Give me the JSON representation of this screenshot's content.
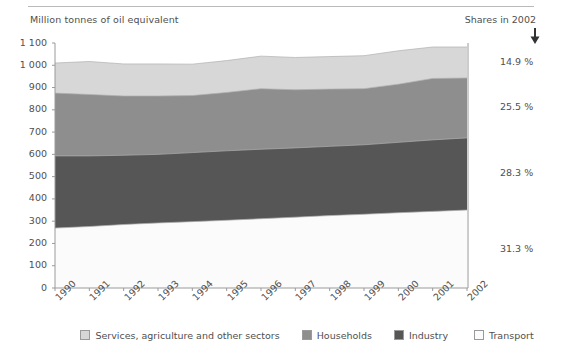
{
  "header": {
    "y_axis_title": "Million tonnes of oil equivalent",
    "shares_title": "Shares in 2002",
    "arrow_icon": "down-arrow-icon"
  },
  "axes": {
    "y_ticks": [
      "0",
      "100",
      "200",
      "300",
      "400",
      "500",
      "600",
      "700",
      "800",
      "900",
      "1 000",
      "1 100"
    ],
    "y_values": [
      0,
      100,
      200,
      300,
      400,
      500,
      600,
      700,
      800,
      900,
      1000,
      1100
    ],
    "x_ticks": [
      "1990",
      "1991",
      "1992",
      "1993",
      "1994",
      "1995",
      "1996",
      "1997",
      "1998",
      "1999",
      "2000",
      "2001",
      "2002"
    ]
  },
  "shares": [
    {
      "label": "14.9 %",
      "series": "Services, agriculture and other sectors"
    },
    {
      "label": "25.5 %",
      "series": "Households"
    },
    {
      "label": "28.3 %",
      "series": "Industry"
    },
    {
      "label": "31.3 %",
      "series": "Transport"
    }
  ],
  "legend": [
    {
      "label": "Services, agriculture and other sectors",
      "color": "#d7d7d7"
    },
    {
      "label": "Households",
      "color": "#8e8e8e"
    },
    {
      "label": "Industry",
      "color": "#565656"
    },
    {
      "label": "Transport",
      "color": "#fbfbfb"
    }
  ],
  "colors": {
    "services": "#d7d7d7",
    "households": "#8e8e8e",
    "industry": "#565656",
    "transport": "#fbfbfb",
    "axis": "#9a9a9a",
    "text": "#4f4f4f",
    "band_edge": "#b0b0b0"
  },
  "chart_data": {
    "type": "area",
    "title": "",
    "subtitle": "",
    "xlabel": "",
    "ylabel": "Million tonnes of oil equivalent",
    "ylim": [
      0,
      1100
    ],
    "grid": false,
    "legend_position": "bottom",
    "stacked": true,
    "stack_order_bottom_to_top": [
      "Transport",
      "Industry",
      "Households",
      "Services, agriculture and other sectors"
    ],
    "x": [
      1990,
      1991,
      1992,
      1993,
      1994,
      1995,
      1996,
      1997,
      1998,
      1999,
      2000,
      2001,
      2002
    ],
    "categories": [
      "1990",
      "1991",
      "1992",
      "1993",
      "1994",
      "1995",
      "1996",
      "1997",
      "1998",
      "1999",
      "2000",
      "2001",
      "2002"
    ],
    "series": [
      {
        "name": "Transport",
        "color": "#fbfbfb",
        "share_2002": "31.3 %",
        "values": [
          269,
          276,
          285,
          292,
          298,
          304,
          311,
          318,
          325,
          331,
          338,
          344,
          350
        ]
      },
      {
        "name": "Industry",
        "color": "#565656",
        "share_2002": "28.3 %",
        "values": [
          324,
          317,
          311,
          308,
          310,
          312,
          312,
          311,
          311,
          312,
          316,
          321,
          324
        ]
      },
      {
        "name": "Households",
        "color": "#8e8e8e",
        "share_2002": "25.5 %",
        "values": [
          282,
          276,
          266,
          262,
          256,
          262,
          272,
          261,
          257,
          252,
          261,
          276,
          269
        ]
      },
      {
        "name": "Services, agriculture and other sectors",
        "color": "#d7d7d7",
        "share_2002": "14.9 %",
        "values": [
          135,
          148,
          144,
          144,
          141,
          143,
          146,
          145,
          146,
          148,
          150,
          141,
          139
        ]
      }
    ],
    "stacked_cumulative_tops": {
      "transport": [
        269,
        276,
        285,
        292,
        298,
        304,
        311,
        318,
        325,
        331,
        338,
        344,
        350
      ],
      "industry": [
        593,
        593,
        596,
        600,
        608,
        616,
        623,
        629,
        636,
        643,
        654,
        665,
        674
      ],
      "households": [
        875,
        869,
        862,
        862,
        864,
        878,
        895,
        890,
        893,
        895,
        915,
        941,
        943
      ],
      "total": [
        1010,
        1017,
        1006,
        1006,
        1005,
        1021,
        1041,
        1035,
        1039,
        1043,
        1065,
        1082,
        1082
      ]
    }
  }
}
